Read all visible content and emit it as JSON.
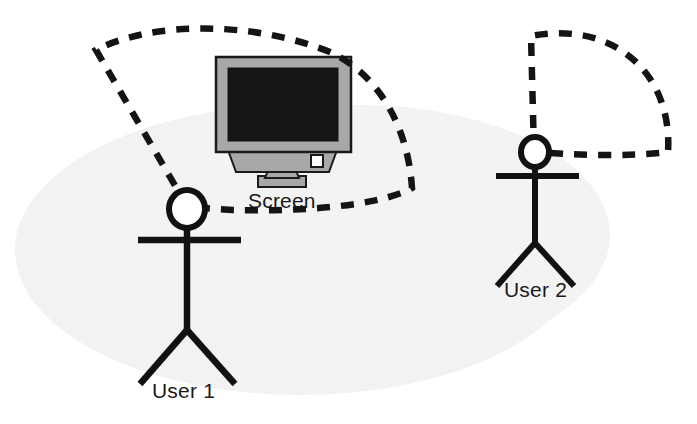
{
  "figure": {
    "type": "diagram",
    "background_color": "#ffffff",
    "shadow_ellipse_color": "#f2f2f2",
    "line_color": "#111111",
    "monitor_bezel_color": "#a8a8a8",
    "monitor_screen_color": "#151515",
    "monitor_stand_color": "#a8a8a8",
    "power_button_color": "#ffffff"
  },
  "labels": {
    "screen": "Screen",
    "user1": "User 1",
    "user2": "User 2"
  },
  "elements": {
    "user1_name": "user-1-stick-figure",
    "user2_name": "user-2-stick-figure",
    "monitor_name": "crt-monitor",
    "user1_cone_name": "user-1-field-of-view",
    "user2_cone_name": "user-2-field-of-view"
  }
}
